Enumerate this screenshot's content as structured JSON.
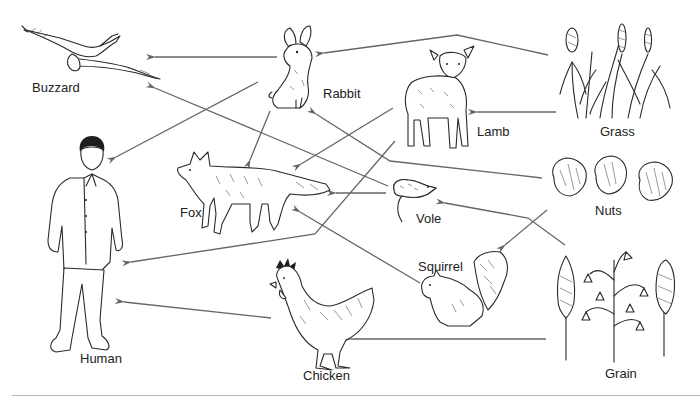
{
  "diagram": {
    "type": "food-web",
    "arrow_color": "#666666",
    "organisms": [
      {
        "id": "buzzard",
        "label": "Buzzard"
      },
      {
        "id": "rabbit",
        "label": "Rabbit"
      },
      {
        "id": "lamb",
        "label": "Lamb"
      },
      {
        "id": "grass",
        "label": "Grass"
      },
      {
        "id": "human",
        "label": "Human"
      },
      {
        "id": "fox",
        "label": "Fox"
      },
      {
        "id": "vole",
        "label": "Vole"
      },
      {
        "id": "nuts",
        "label": "Nuts"
      },
      {
        "id": "squirrel",
        "label": "Squirrel"
      },
      {
        "id": "chicken",
        "label": "Chicken"
      },
      {
        "id": "grain",
        "label": "Grain"
      }
    ],
    "arrows": [
      {
        "from": "Rabbit",
        "to": "Buzzard"
      },
      {
        "from": "Grass",
        "to": "Rabbit"
      },
      {
        "from": "Grass",
        "to": "Lamb"
      },
      {
        "from": "Rabbit",
        "to": "Human"
      },
      {
        "from": "Rabbit",
        "to": "Fox"
      },
      {
        "from": "Lamb",
        "to": "Fox"
      },
      {
        "from": "Lamb",
        "to": "Human"
      },
      {
        "from": "Vole",
        "to": "Buzzard"
      },
      {
        "from": "Vole",
        "to": "Fox"
      },
      {
        "from": "Nuts",
        "to": "Rabbit"
      },
      {
        "from": "Nuts",
        "to": "Squirrel"
      },
      {
        "from": "Grain",
        "to": "Vole"
      },
      {
        "from": "Squirrel",
        "to": "Fox"
      },
      {
        "from": "Chicken",
        "to": "Human"
      },
      {
        "from": "Grain",
        "to": "Chicken"
      }
    ]
  }
}
